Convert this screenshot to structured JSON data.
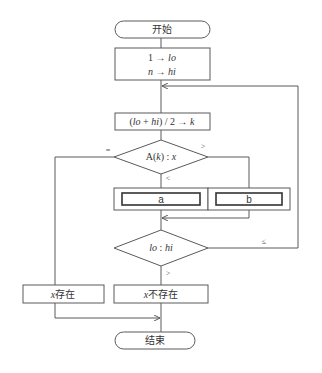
{
  "diagram": {
    "type": "flowchart",
    "start": {
      "label": "开始"
    },
    "init": {
      "line1": "1 → lo",
      "line2": "n → hi"
    },
    "compute_k": {
      "label": "(lo + hi) / 2 → k"
    },
    "decision_compare": {
      "label": "A(k) : x",
      "branches": {
        "equal": "=",
        "greater": ">",
        "less": "<"
      }
    },
    "process_a": {
      "label": "a"
    },
    "process_b": {
      "label": "b"
    },
    "decision_loop": {
      "label": "lo : hi",
      "branches": {
        "le": "≤",
        "gt": ">"
      }
    },
    "found": {
      "label": "x存在"
    },
    "not_found": {
      "label": "x不存在"
    },
    "end": {
      "label": "结束"
    }
  }
}
